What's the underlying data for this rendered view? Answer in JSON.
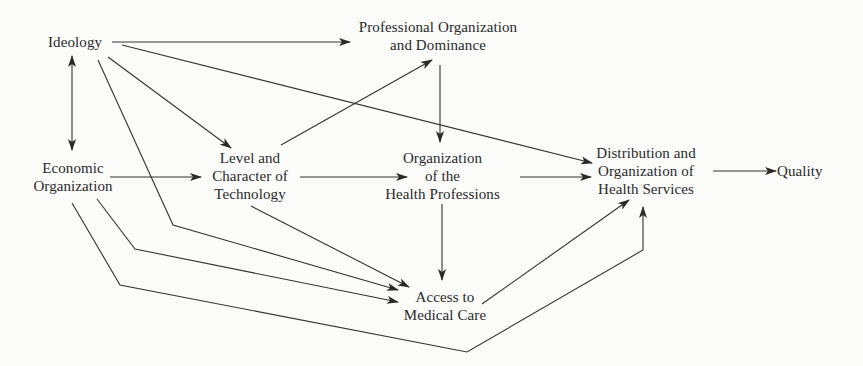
{
  "diagram": {
    "nodes": {
      "ideology": {
        "lines": [
          "Ideology"
        ]
      },
      "economic_organization": {
        "lines": [
          "Economic",
          "Organization"
        ]
      },
      "level_character_technology": {
        "lines": [
          "Level and",
          "Character of",
          "Technology"
        ]
      },
      "professional_organization_dominance": {
        "lines": [
          "Professional Organization",
          "and Dominance"
        ]
      },
      "organization_health_professions": {
        "lines": [
          "Organization",
          "of the",
          "Health Professions"
        ]
      },
      "distribution_organization_health_services": {
        "lines": [
          "Distribution and",
          "Organization of",
          "Health Services"
        ]
      },
      "access_medical_care": {
        "lines": [
          "Access to",
          "Medical Care"
        ]
      },
      "quality": {
        "lines": [
          "Quality"
        ]
      }
    },
    "edges": [
      {
        "from": "Ideology",
        "to": "Professional Organization and Dominance"
      },
      {
        "from": "Ideology",
        "to": "Distribution and Organization of Health Services"
      },
      {
        "from": "Ideology",
        "to": "Level and Character of Technology"
      },
      {
        "from": "Ideology",
        "to": "Access to Medical Care"
      },
      {
        "from": "Ideology",
        "to": "Economic Organization",
        "bidirectional": true
      },
      {
        "from": "Economic Organization",
        "to": "Level and Character of Technology"
      },
      {
        "from": "Economic Organization",
        "to": "Access to Medical Care"
      },
      {
        "from": "Economic Organization",
        "to": "Distribution and Organization of Health Services"
      },
      {
        "from": "Level and Character of Technology",
        "to": "Professional Organization and Dominance"
      },
      {
        "from": "Level and Character of Technology",
        "to": "Organization of the Health Professions"
      },
      {
        "from": "Level and Character of Technology",
        "to": "Access to Medical Care"
      },
      {
        "from": "Professional Organization and Dominance",
        "to": "Organization of the Health Professions"
      },
      {
        "from": "Organization of the Health Professions",
        "to": "Distribution and Organization of Health Services"
      },
      {
        "from": "Organization of the Health Professions",
        "to": "Access to Medical Care"
      },
      {
        "from": "Access to Medical Care",
        "to": "Distribution and Organization of Health Services"
      },
      {
        "from": "Distribution and Organization of Health Services",
        "to": "Quality"
      }
    ],
    "colors": {
      "background": "#fbfbfa",
      "ink": "#2a2a2a"
    }
  }
}
